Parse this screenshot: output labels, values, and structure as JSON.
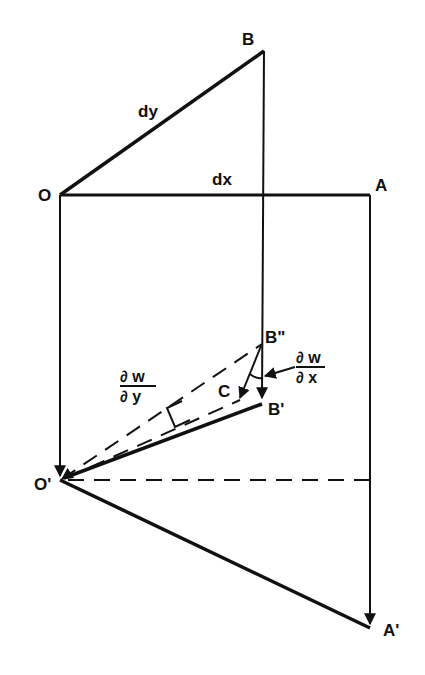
{
  "diagram": {
    "points": {
      "O": {
        "label": "O",
        "x": 60,
        "y": 195
      },
      "A": {
        "label": "A",
        "x": 370,
        "y": 195
      },
      "B": {
        "label": "B",
        "x": 264,
        "y": 51
      },
      "O_prime": {
        "label": "O'",
        "x": 60,
        "y": 480
      },
      "A_prime": {
        "label": "A'",
        "x": 370,
        "y": 628
      },
      "B_double_prime": {
        "label": "B\"",
        "x": 262,
        "y": 344
      },
      "B_prime": {
        "label": "B'",
        "x": 262,
        "y": 402
      },
      "C": {
        "label": "C",
        "x": 240,
        "y": 400
      }
    },
    "edge_labels": {
      "dy": "dy",
      "dx": "dx"
    },
    "fractions": {
      "dw_dx": {
        "numerator": "∂ w",
        "denominator": "∂ x"
      },
      "dw_dy": {
        "numerator": "∂ w",
        "denominator": "∂ y"
      }
    },
    "colors": {
      "ink": "#111111",
      "background": "#ffffff"
    }
  }
}
